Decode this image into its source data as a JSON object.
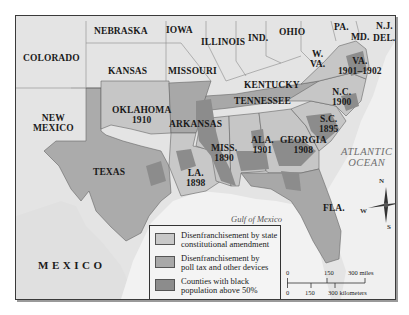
{
  "map": {
    "colors": {
      "background_land": "#e8e8e8",
      "ocean": "#f3f3f3",
      "constitutional_amendment": "#c8c8c8",
      "poll_tax": "#a8a8a8",
      "black_majority_counties": "#8c8c8c",
      "border": "#555555"
    },
    "states": [
      {
        "name": "NEBRASKA",
        "year": ""
      },
      {
        "name": "IOWA",
        "year": ""
      },
      {
        "name": "ILLINOIS",
        "year": ""
      },
      {
        "name": "IND.",
        "year": ""
      },
      {
        "name": "OHIO",
        "year": ""
      },
      {
        "name": "PA.",
        "year": ""
      },
      {
        "name": "N.J.",
        "year": ""
      },
      {
        "name": "MD.",
        "year": ""
      },
      {
        "name": "DEL.",
        "year": ""
      },
      {
        "name": "COLORADO",
        "year": ""
      },
      {
        "name": "KANSAS",
        "year": ""
      },
      {
        "name": "MISSOURI",
        "year": ""
      },
      {
        "name": "KENTUCKY",
        "year": ""
      },
      {
        "name": "W.",
        "year": "VA."
      },
      {
        "name": "VA.",
        "year": "1901–1902"
      },
      {
        "name": "NEW",
        "year": "MEXICO"
      },
      {
        "name": "OKLAHOMA",
        "year": "1910"
      },
      {
        "name": "ARKANSAS",
        "year": ""
      },
      {
        "name": "TENNESSEE",
        "year": ""
      },
      {
        "name": "N.C.",
        "year": "1900"
      },
      {
        "name": "S.C.",
        "year": "1895"
      },
      {
        "name": "TEXAS",
        "year": ""
      },
      {
        "name": "MISS.",
        "year": "1890"
      },
      {
        "name": "ALA.",
        "year": "1901"
      },
      {
        "name": "GEORGIA",
        "year": "1908"
      },
      {
        "name": "LA.",
        "year": "1898"
      },
      {
        "name": "FLA.",
        "year": ""
      }
    ],
    "water": {
      "atlantic_line1": "ATLANTIC",
      "atlantic_line2": "OCEAN",
      "gulf": "Gulf of Mexico"
    },
    "country": "MEXICO",
    "compass": {
      "n": "N",
      "s": "S",
      "e": "E",
      "w": "W"
    },
    "legend": {
      "items": [
        {
          "line1": "Disenfranchisement by state",
          "line2": "constitutional amendment",
          "color": "#c8c8c8"
        },
        {
          "line1": "Disenfranchisement by",
          "line2": "poll tax and other devices",
          "color": "#a8a8a8"
        },
        {
          "line1": "Counties with black",
          "line2": "population above 50%",
          "color": "#8c8c8c"
        }
      ]
    },
    "scale": {
      "miles": [
        "0",
        "150",
        "300 miles"
      ],
      "kilometers": [
        "0",
        "150",
        "300 kilometers"
      ]
    }
  }
}
